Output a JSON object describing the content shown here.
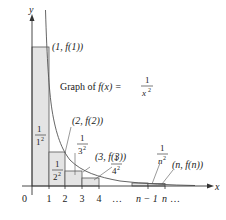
{
  "diagram": {
    "axes": {
      "x_label": "x",
      "y_label": "y",
      "origin_label": "0",
      "x_ticks": [
        "1",
        "2",
        "3",
        "4",
        "…",
        "n − 1",
        "n",
        "…"
      ]
    },
    "curve": {
      "label_prefix": "Graph of ",
      "label_fx": "f(x) = ",
      "label_num": "1",
      "label_den": "x",
      "label_exp": "2"
    },
    "points": [
      {
        "label": "(1, f(1))"
      },
      {
        "label": "(2, f(2))"
      },
      {
        "label": "(3, f(3))"
      },
      {
        "label": "(n, f(n))"
      }
    ],
    "rect_labels": [
      {
        "num": "1",
        "den": "1",
        "exp": "2"
      },
      {
        "num": "1",
        "den": "2",
        "exp": "2"
      },
      {
        "num": "1",
        "den": "3",
        "exp": "2"
      },
      {
        "num": "1",
        "den": "4",
        "exp": "2"
      },
      {
        "num": "1",
        "den": "n",
        "exp": "2"
      }
    ],
    "colors": {
      "rect_fill": "#e4e4e4",
      "rect_stroke": "#555555",
      "curve": "#555555",
      "axis": "#333333"
    }
  }
}
